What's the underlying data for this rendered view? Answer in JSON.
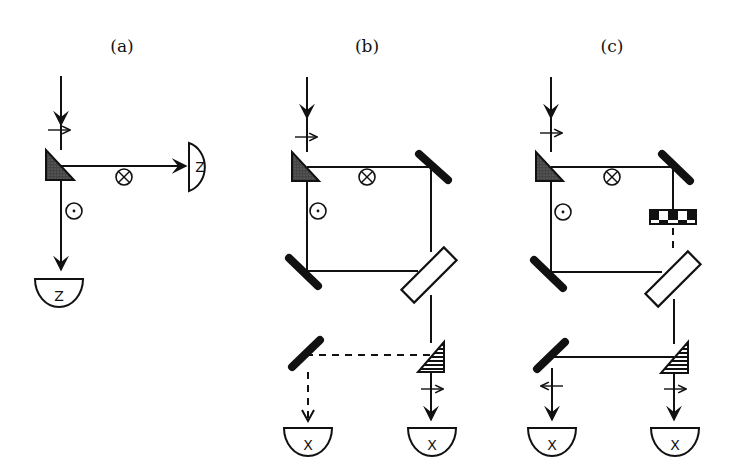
{
  "figure": {
    "panels": [
      {
        "id": "a",
        "label": "(a)",
        "description": "Polarizing beam splitter separating input beam into two orthogonal polarizations, each sent to a Z detector",
        "detectors": [
          {
            "id": "a-det-right",
            "label": "Z"
          },
          {
            "id": "a-det-bottom",
            "label": "Z"
          }
        ],
        "polarization_marks": [
          "horizontal-arrow",
          "into-page (⊗)",
          "out-of-page (⊙)"
        ]
      },
      {
        "id": "b",
        "label": "(b)",
        "description": "Polarizing splitter followed by mirrors and a beam splitter recombining arms; output to two X detectors, one path dashed",
        "detectors": [
          {
            "id": "b-det-left",
            "label": "X"
          },
          {
            "id": "b-det-right",
            "label": "X"
          }
        ],
        "polarization_marks": [
          "horizontal-arrow",
          "into-page (⊗)",
          "out-of-page (⊙)",
          "horizontal-arrow"
        ]
      },
      {
        "id": "c",
        "label": "(c)",
        "description": "Same as (b) with a checkered element (phase shifter) inserted in one arm; both outputs solid to two X detectors",
        "detectors": [
          {
            "id": "c-det-left",
            "label": "X"
          },
          {
            "id": "c-det-right",
            "label": "X"
          }
        ],
        "polarization_marks": [
          "horizontal-arrow",
          "into-page (⊗)",
          "out-of-page (⊙)",
          "left-arrow",
          "right-arrow"
        ]
      }
    ],
    "colors": {
      "ink": "#111111",
      "background": "#ffffff"
    }
  }
}
